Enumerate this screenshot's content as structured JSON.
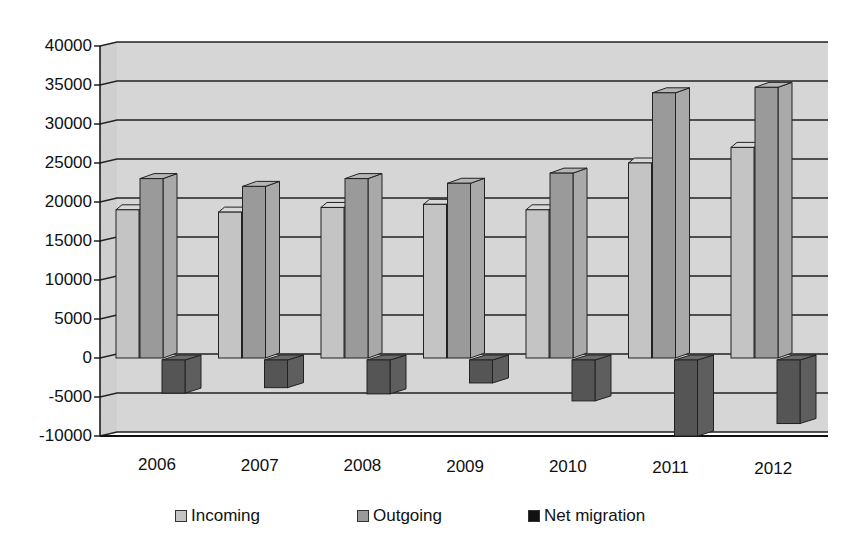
{
  "chart_data": {
    "type": "bar",
    "style": "3d-clustered-column",
    "title": "",
    "xlabel": "",
    "ylabel": "",
    "categories": [
      "2006",
      "2007",
      "2008",
      "2009",
      "2010",
      "2011",
      "2012"
    ],
    "series": [
      {
        "name": "Incoming",
        "color": "#c4c4c4",
        "values": [
          19000,
          18700,
          19300,
          19700,
          19000,
          25000,
          27000
        ]
      },
      {
        "name": "Outgoing",
        "color": "#9a9a9a",
        "values": [
          23000,
          22000,
          23000,
          22400,
          23700,
          34000,
          34700
        ]
      },
      {
        "name": "Net migration",
        "color": "#555555",
        "values": [
          -4500,
          -3800,
          -4600,
          -3200,
          -5500,
          -10000,
          -8400
        ]
      }
    ],
    "ylim": [
      -10000,
      40000
    ],
    "yticks": [
      "40000",
      "35000",
      "30000",
      "25000",
      "20000",
      "15000",
      "10000",
      "5000",
      "0",
      "-5000",
      "-10000"
    ],
    "grid": true,
    "legend_position": "bottom"
  },
  "legend": {
    "items": [
      {
        "label": "Incoming",
        "color": "#c4c4c4"
      },
      {
        "label": "Outgoing",
        "color": "#9a9a9a"
      },
      {
        "label": "Net migration",
        "color": "#111111"
      }
    ]
  }
}
